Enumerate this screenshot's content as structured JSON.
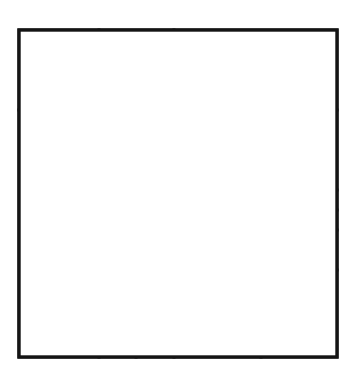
{
  "figure": {
    "type": "geometric-dissection-diagram",
    "background_color": "#ffffff",
    "line_color": "#151515",
    "line_width_px": 3,
    "canvas": {
      "width": 356,
      "height": 369
    }
  },
  "outer_square": {
    "name": "outer-square",
    "x": 19,
    "y": 30,
    "width": 318,
    "height": 327
  },
  "cells": [
    {
      "id": "top-left",
      "label": "",
      "x": 19,
      "y": 30,
      "width": 80,
      "height": 80
    },
    {
      "id": "top-middle",
      "label": "",
      "x": 99,
      "y": 30,
      "width": 75,
      "height": 80
    },
    {
      "id": "top-right",
      "label": "",
      "x": 174,
      "y": 30,
      "width": 163,
      "height": 80
    },
    {
      "id": "left-tall",
      "label": "",
      "x": 19,
      "y": 110,
      "width": 80,
      "height": 247
    },
    {
      "id": "center-tall",
      "label": "",
      "x": 99,
      "y": 110,
      "width": 75,
      "height": 166
    },
    {
      "id": "upper-right-wide",
      "label": "",
      "x": 174,
      "y": 110,
      "width": 163,
      "height": 80
    },
    {
      "id": "center-large",
      "label": "",
      "x": 174,
      "y": 190,
      "width": 87,
      "height": 167
    },
    {
      "id": "right-tall-mid",
      "label": "",
      "x": 261,
      "y": 190,
      "width": 44,
      "height": 80
    },
    {
      "id": "tiny-upper-left",
      "label": "",
      "x": 305,
      "y": 190,
      "width": 19,
      "height": 40
    },
    {
      "id": "tiny-upper-right",
      "label": "",
      "x": 324,
      "y": 190,
      "width": 13,
      "height": 20
    },
    {
      "id": "tiny-lower-right",
      "label": "",
      "x": 324,
      "y": 210,
      "width": 13,
      "height": 20
    },
    {
      "id": "right-small-sq",
      "label": "",
      "x": 305,
      "y": 230,
      "width": 32,
      "height": 40
    },
    {
      "id": "bottom-right",
      "label": "",
      "x": 261,
      "y": 270,
      "width": 76,
      "height": 87
    },
    {
      "id": "grid-top-left",
      "label": "",
      "x": 99,
      "y": 276,
      "width": 37,
      "height": 41
    },
    {
      "id": "grid-top-right",
      "label": "",
      "x": 136,
      "y": 276,
      "width": 38,
      "height": 41
    },
    {
      "id": "grid-bottom-left",
      "label": "",
      "x": 99,
      "y": 317,
      "width": 37,
      "height": 40
    },
    {
      "id": "grid-bottom-right",
      "label": "",
      "x": 136,
      "y": 317,
      "width": 38,
      "height": 40
    }
  ]
}
